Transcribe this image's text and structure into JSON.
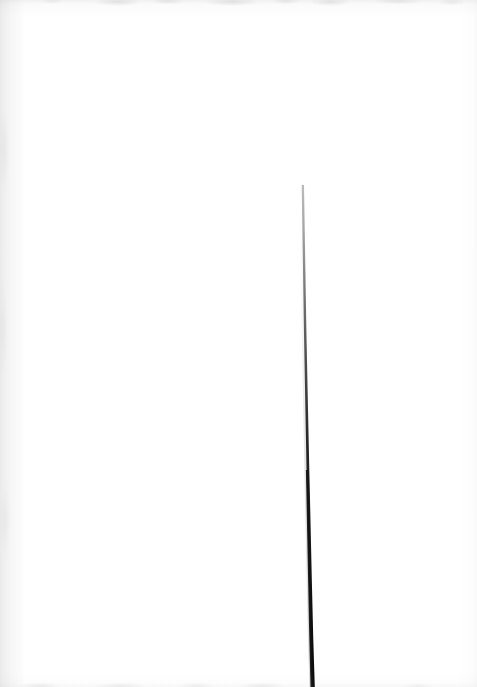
{
  "page": {
    "width": 477,
    "height": 687,
    "background_color": "#ffffff",
    "content_description": "Near-blank scanned white page with a single thin vertical stroke",
    "text_content": ""
  },
  "artwork": {
    "name": "vertical-stroke",
    "kind": "hand-drawn-line",
    "color": "#0a0a0a",
    "description": "A single thin near-vertical stroke that begins extremely faint in the upper middle of the page and descends, slanting slightly to the right, growing darker and thicker until it runs off the bottom edge.",
    "start_point": {
      "x": 302,
      "y": 185
    },
    "end_point": {
      "x": 313,
      "y": 687
    },
    "path_points": [
      {
        "x": 302,
        "y": 185,
        "width": 0.7,
        "opacity": 0.04
      },
      {
        "x": 303,
        "y": 240,
        "width": 0.9,
        "opacity": 0.1
      },
      {
        "x": 304,
        "y": 300,
        "width": 1.1,
        "opacity": 0.22
      },
      {
        "x": 305,
        "y": 350,
        "width": 1.3,
        "opacity": 0.38
      },
      {
        "x": 306,
        "y": 400,
        "width": 1.6,
        "opacity": 0.58
      },
      {
        "x": 307,
        "y": 440,
        "width": 1.9,
        "opacity": 0.72
      },
      {
        "x": 308,
        "y": 490,
        "width": 2.2,
        "opacity": 0.86
      },
      {
        "x": 309,
        "y": 540,
        "width": 2.5,
        "opacity": 0.93
      },
      {
        "x": 310,
        "y": 590,
        "width": 2.8,
        "opacity": 0.96
      },
      {
        "x": 311,
        "y": 640,
        "width": 3.1,
        "opacity": 0.98
      },
      {
        "x": 313,
        "y": 687,
        "width": 3.4,
        "opacity": 1.0
      }
    ]
  },
  "scan_artifacts": {
    "top_edge": {
      "name": "top-scan-edge",
      "color": "#7a7a82",
      "description": "mottled grey band along top edge"
    },
    "bottom_edge": {
      "name": "bottom-scan-edge",
      "color": "#7a7a82",
      "description": "mottled grey band along bottom edge"
    },
    "left_edge": {
      "name": "left-scan-streak",
      "color": "#80808a",
      "description": "faint vertical grey streak along left margin"
    },
    "right_edge": {
      "name": "right-scan-edge",
      "color": "#a0a0a8",
      "description": "very faint grey falloff along right margin"
    }
  }
}
